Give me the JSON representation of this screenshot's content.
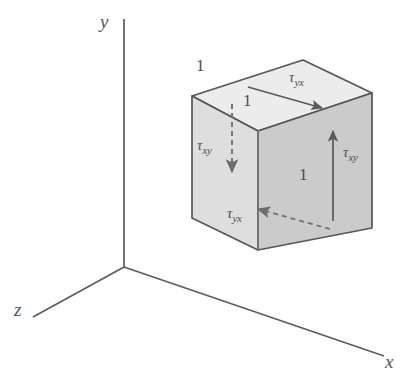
{
  "figure": {
    "background_color": "#ffffff",
    "stroke_color": "#4a4a4a",
    "axes": {
      "origin_label": "",
      "y_axis_label": "y",
      "z_axis_label": "z",
      "x_axis_label": "x"
    },
    "cube": {
      "top_face_color": "#ededed",
      "front_face_color": "#dcdcdc",
      "right_face_color": "#c9c9c9",
      "edge_color": "#555555"
    },
    "dimensions": [
      {
        "id": "top-left",
        "value": "1",
        "edge": "top-back-left-edge"
      },
      {
        "id": "top-inner",
        "value": "1",
        "edge": "top-front-depth-edge"
      },
      {
        "id": "right",
        "value": "1",
        "edge": "right-face-vertical-edge"
      }
    ],
    "stresses": [
      {
        "id": "top",
        "symbol": "τ",
        "subscript": "yx",
        "face": "top",
        "arrow_direction": "right",
        "arrow_style": "solid"
      },
      {
        "id": "left",
        "symbol": "τ",
        "subscript": "xy",
        "face": "back-left",
        "arrow_direction": "down",
        "arrow_style": "dashed"
      },
      {
        "id": "bottom",
        "symbol": "τ",
        "subscript": "yx",
        "face": "bottom",
        "arrow_direction": "left",
        "arrow_style": "dashed"
      },
      {
        "id": "right",
        "symbol": "τ",
        "subscript": "xy",
        "face": "right",
        "arrow_direction": "up",
        "arrow_style": "solid"
      }
    ]
  }
}
